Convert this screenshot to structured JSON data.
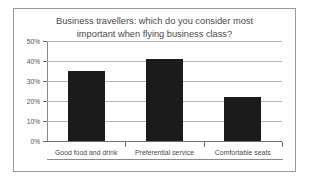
{
  "chart_data": {
    "type": "bar",
    "title": "Business travellers: which do you consider most important when flying business class?",
    "title_lines": [
      "Business travellers: which do you consider most",
      "important when flying business class?"
    ],
    "categories": [
      "Good food and drink",
      "Preferential service",
      "Comfortable seats"
    ],
    "values": [
      35,
      41,
      22
    ],
    "value_labels": [
      "35%",
      "41%",
      "22%"
    ],
    "xlabel": "",
    "ylabel": "",
    "ylim": [
      0,
      50
    ],
    "ytick_values": [
      0,
      10,
      20,
      30,
      40,
      50
    ],
    "ytick_labels": [
      "0%",
      "10%",
      "20%",
      "30%",
      "40%",
      "50%"
    ],
    "grid": true,
    "legend": false,
    "legend_position": "none",
    "bar_color": "#1b1b1b",
    "gridline_color": "#b4b4b4",
    "axis_color": "#6d6d6d",
    "text_color": "#4a4a4a",
    "background_color": "#ffffff",
    "border_color": "#9a9a9a"
  }
}
